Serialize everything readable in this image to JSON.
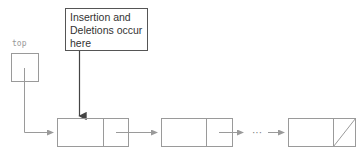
{
  "diagram": {
    "top_pointer_label": "top",
    "callout_text": "Insertion and Deletions occur here",
    "ellipsis": "···",
    "nodes": [
      {
        "id": "node-1",
        "next": "node-2",
        "null_link": false
      },
      {
        "id": "node-2",
        "next": "...",
        "null_link": false
      },
      {
        "id": "node-3",
        "next": null,
        "null_link": true
      }
    ],
    "colors": {
      "line": "#9a9a9a",
      "callout_border": "#555555",
      "callout_arrow": "#444444",
      "text": "#333333",
      "label": "#999999"
    }
  }
}
